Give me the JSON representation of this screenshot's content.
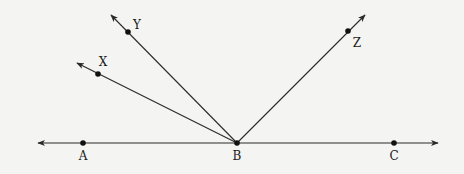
{
  "diagram": {
    "colors": {
      "line": "#2a2a2a",
      "point": "#111111",
      "background": "#f4f4f2"
    },
    "vertex": {
      "label": "B",
      "x": 237,
      "y": 143
    },
    "line": {
      "x1": 38,
      "y1": 143,
      "x2": 438,
      "y2": 143
    },
    "points": [
      {
        "label": "A",
        "x": 83,
        "y": 143,
        "lx": 83,
        "ly": 156
      },
      {
        "label": "B",
        "x": 237,
        "y": 143,
        "lx": 237,
        "ly": 156
      },
      {
        "label": "C",
        "x": 394,
        "y": 143,
        "lx": 394,
        "ly": 156
      },
      {
        "label": "X",
        "x": 98,
        "y": 74,
        "lx": 103,
        "ly": 62
      },
      {
        "label": "Y",
        "x": 128,
        "y": 32,
        "lx": 137,
        "ly": 25
      },
      {
        "label": "Z",
        "x": 348,
        "y": 31,
        "lx": 357,
        "ly": 43
      }
    ],
    "rays": [
      {
        "name": "BX",
        "x2": 77,
        "y2": 63
      },
      {
        "name": "BY",
        "x2": 111,
        "y2": 15
      },
      {
        "name": "BZ",
        "x2": 365,
        "y2": 15
      }
    ]
  }
}
